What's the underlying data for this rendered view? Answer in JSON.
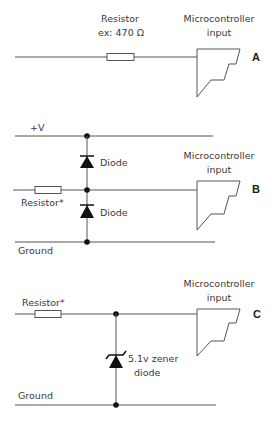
{
  "circuits": {
    "a": {
      "tag": "A",
      "resistor_label_line1": "Resistor",
      "resistor_label_line2": "ex: 470 Ω",
      "mcu_label_line1": "Microcontroller",
      "mcu_label_line2": "input"
    },
    "b": {
      "tag": "B",
      "supply_label": "+V",
      "diode_top_label": "Diode",
      "diode_bottom_label": "Diode",
      "resistor_label": "Resistor*",
      "ground_label": "Ground",
      "mcu_label_line1": "Microcontroller",
      "mcu_label_line2": "input"
    },
    "c": {
      "tag": "C",
      "resistor_label": "Resistor*",
      "zener_label_line1": "5.1v zener",
      "zener_label_line2": "diode",
      "ground_label": "Ground",
      "mcu_label_line1": "Microcontroller",
      "mcu_label_line2": "input"
    }
  },
  "colors": {
    "wire": "#555555",
    "text": "#3a3a3a",
    "component_fill": "#111111",
    "background": "#ffffff"
  }
}
